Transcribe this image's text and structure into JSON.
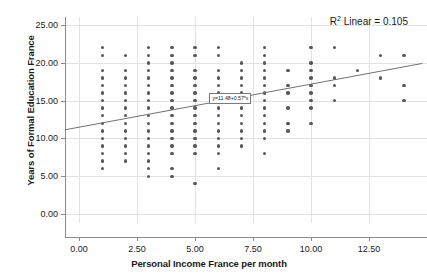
{
  "chart_data": {
    "type": "scatter",
    "title": "",
    "xlabel": "Personal Income France per month",
    "ylabel": "Years of Formal Education France",
    "xlim": [
      -0.6,
      15.0
    ],
    "ylim": [
      -1.2,
      26.0
    ],
    "xticks": [
      "0.00",
      "2.50",
      "5.00",
      "7.50",
      "10.00",
      "12.50"
    ],
    "xtick_values": [
      0,
      2.5,
      5,
      7.5,
      10,
      12.5
    ],
    "yticks": [
      "0.00",
      "5.00",
      "10.00",
      "15.00",
      "20.00",
      "25.00"
    ],
    "ytick_values": [
      0,
      5,
      10,
      15,
      20,
      25
    ],
    "grid": true,
    "legend": "none",
    "annotations": [
      {
        "name": "r-squared",
        "text": "R² Linear = 0.105",
        "position": "top-right"
      },
      {
        "name": "fit-equation",
        "text": "y=11.48+0.57*x",
        "x": 6.4,
        "y": 15.4
      }
    ],
    "fit_line": {
      "type": "linear",
      "intercept": 11.48,
      "slope": 0.57,
      "x_start": -0.6,
      "x_end": 14.8,
      "color": "#6e7074"
    },
    "marker": {
      "shape": "circle",
      "color": "#56585c",
      "size": 3.4
    },
    "points": [
      [
        1,
        22
      ],
      [
        1,
        21
      ],
      [
        1,
        19
      ],
      [
        1,
        18
      ],
      [
        1,
        17
      ],
      [
        1,
        16
      ],
      [
        1,
        15
      ],
      [
        1,
        14
      ],
      [
        1,
        13
      ],
      [
        1,
        12
      ],
      [
        1,
        11
      ],
      [
        1,
        10
      ],
      [
        1,
        9
      ],
      [
        1,
        8
      ],
      [
        1,
        7
      ],
      [
        1,
        6
      ],
      [
        2,
        21
      ],
      [
        2,
        19
      ],
      [
        2,
        18
      ],
      [
        2,
        17
      ],
      [
        2,
        16
      ],
      [
        2,
        15
      ],
      [
        2,
        14
      ],
      [
        2,
        13
      ],
      [
        2,
        12
      ],
      [
        2,
        11
      ],
      [
        2,
        10
      ],
      [
        2,
        9
      ],
      [
        2,
        8
      ],
      [
        2,
        7
      ],
      [
        3,
        22
      ],
      [
        3,
        21
      ],
      [
        3,
        20
      ],
      [
        3,
        19
      ],
      [
        3,
        18
      ],
      [
        3,
        17
      ],
      [
        3,
        16
      ],
      [
        3,
        15
      ],
      [
        3,
        14
      ],
      [
        3,
        13
      ],
      [
        3,
        12
      ],
      [
        3,
        11
      ],
      [
        3,
        10
      ],
      [
        3,
        9
      ],
      [
        3,
        8
      ],
      [
        3,
        7
      ],
      [
        3,
        6
      ],
      [
        3,
        5
      ],
      [
        4,
        22
      ],
      [
        4,
        21
      ],
      [
        4,
        20
      ],
      [
        4,
        19
      ],
      [
        4,
        18
      ],
      [
        4,
        17
      ],
      [
        4,
        16
      ],
      [
        4,
        15
      ],
      [
        4,
        14
      ],
      [
        4,
        13
      ],
      [
        4,
        12
      ],
      [
        4,
        11
      ],
      [
        4,
        10
      ],
      [
        4,
        9
      ],
      [
        4,
        8
      ],
      [
        4,
        6
      ],
      [
        4,
        5
      ],
      [
        5,
        22
      ],
      [
        5,
        21
      ],
      [
        5,
        19
      ],
      [
        5,
        18
      ],
      [
        5,
        17
      ],
      [
        5,
        16
      ],
      [
        5,
        15
      ],
      [
        5,
        14
      ],
      [
        5,
        13
      ],
      [
        5,
        12
      ],
      [
        5,
        11
      ],
      [
        5,
        10
      ],
      [
        5,
        9
      ],
      [
        5,
        8
      ],
      [
        5,
        4
      ],
      [
        6,
        22
      ],
      [
        6,
        21
      ],
      [
        6,
        19
      ],
      [
        6,
        18
      ],
      [
        6,
        17
      ],
      [
        6,
        16
      ],
      [
        6,
        15
      ],
      [
        6,
        14
      ],
      [
        6,
        13
      ],
      [
        6,
        12
      ],
      [
        6,
        11
      ],
      [
        6,
        10
      ],
      [
        6,
        9
      ],
      [
        6,
        8
      ],
      [
        6,
        6
      ],
      [
        7,
        20
      ],
      [
        7,
        19
      ],
      [
        7,
        18
      ],
      [
        7,
        17
      ],
      [
        7,
        16
      ],
      [
        7,
        15
      ],
      [
        7,
        14
      ],
      [
        7,
        13
      ],
      [
        7,
        12
      ],
      [
        7,
        11
      ],
      [
        7,
        10
      ],
      [
        7,
        9
      ],
      [
        8,
        22
      ],
      [
        8,
        21
      ],
      [
        8,
        20
      ],
      [
        8,
        19
      ],
      [
        8,
        18
      ],
      [
        8,
        17
      ],
      [
        8,
        16
      ],
      [
        8,
        15
      ],
      [
        8,
        14
      ],
      [
        8,
        13
      ],
      [
        8,
        12
      ],
      [
        8,
        11
      ],
      [
        8,
        10
      ],
      [
        8,
        8
      ],
      [
        9,
        19
      ],
      [
        9,
        17
      ],
      [
        9,
        16
      ],
      [
        9,
        14
      ],
      [
        9,
        12
      ],
      [
        9,
        11
      ],
      [
        10,
        22
      ],
      [
        10,
        20
      ],
      [
        10,
        19
      ],
      [
        10,
        18
      ],
      [
        10,
        17
      ],
      [
        10,
        16
      ],
      [
        10,
        15
      ],
      [
        10,
        14
      ],
      [
        10,
        12
      ],
      [
        11,
        22
      ],
      [
        11,
        18
      ],
      [
        11,
        17
      ],
      [
        11,
        15
      ],
      [
        12,
        19
      ],
      [
        13,
        21
      ],
      [
        13,
        18
      ],
      [
        14,
        21
      ],
      [
        14,
        17
      ],
      [
        14,
        15
      ]
    ]
  }
}
